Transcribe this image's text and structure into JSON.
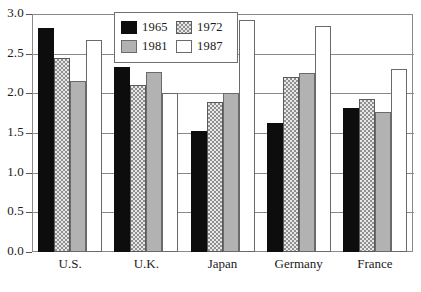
{
  "chart_data": {
    "type": "bar",
    "title": "",
    "subtitle": "",
    "xlabel": "",
    "ylabel": "",
    "categories": [
      "U.S.",
      "U.K.",
      "Japan",
      "Germany",
      "France"
    ],
    "series": [
      {
        "name": "1965",
        "values": [
          2.83,
          2.33,
          1.52,
          1.62,
          1.82
        ]
      },
      {
        "name": "1972",
        "values": [
          2.44,
          2.1,
          1.89,
          2.21,
          1.93
        ]
      },
      {
        "name": "1981",
        "values": [
          2.16,
          2.27,
          2.01,
          2.26,
          1.77
        ]
      },
      {
        "name": "1987",
        "values": [
          2.67,
          2.0,
          2.93,
          2.85,
          2.31
        ]
      }
    ],
    "ylim": [
      0.0,
      3.0
    ],
    "ytick_labels": [
      "0.0",
      "0.5",
      "1.0",
      "1.5",
      "2.0",
      "2.5",
      "3.0"
    ],
    "ytick_values": [
      0.0,
      0.5,
      1.0,
      1.5,
      2.0,
      2.5,
      3.0
    ],
    "grid": true,
    "grid_axis": "y",
    "legend_position": "top-center",
    "legend_entries": [
      "1965",
      "1972",
      "1981",
      "1987"
    ],
    "series_colors": [
      "#0d0d0d",
      "#e8e8e8",
      "#b2b2b2",
      "#ffffff"
    ],
    "frame_color": "#8a8a8a",
    "annotations": []
  }
}
